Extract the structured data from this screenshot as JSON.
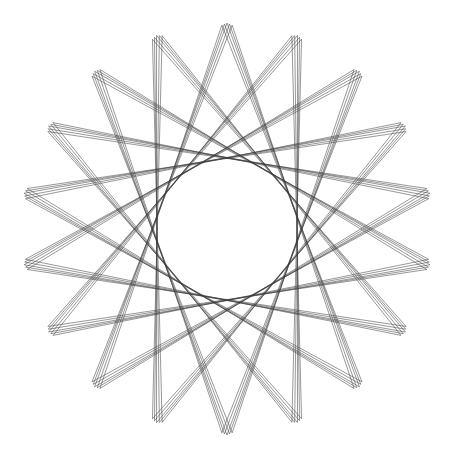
{
  "figure": {
    "width": 449,
    "height": 458,
    "background": "#ffffff",
    "stroke_color": "#3a3a3a",
    "center": [
      227,
      229
    ],
    "inner_radius": 19,
    "outer_radius": 206,
    "petals": 18,
    "lines_per_band": 5,
    "band_spacing": 2.6,
    "skip": 7,
    "stroke_width": 0.7,
    "stroke_opacity": 0.75
  }
}
